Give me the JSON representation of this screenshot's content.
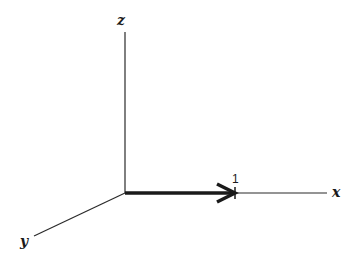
{
  "diagram": {
    "type": "3d-coordinate-axes",
    "axes": {
      "x": {
        "label": "x"
      },
      "y": {
        "label": "y"
      },
      "z": {
        "label": "z"
      }
    },
    "vector": {
      "direction": "x",
      "length_label": "1"
    },
    "colors": {
      "line": "#2a2a2a",
      "vector": "#1a1a1a",
      "background": "#ffffff"
    }
  }
}
